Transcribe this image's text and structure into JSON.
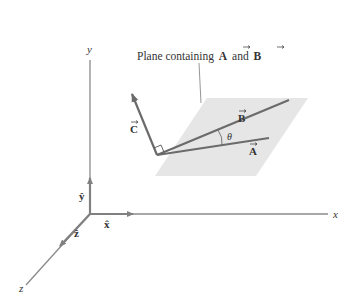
{
  "diagram": {
    "caption": "Plane containing",
    "caption_vec_a": "A",
    "caption_and": "and",
    "caption_vec_b": "B",
    "axes": {
      "x_label": "x",
      "y_label": "y",
      "z_label": "z"
    },
    "unit_vectors": {
      "x_hat": "x̂",
      "y_hat": "ŷ",
      "z_hat": "ẑ"
    },
    "vectors": {
      "a_label": "A",
      "b_label": "B",
      "c_label": "C"
    },
    "angle_label": "θ",
    "colors": {
      "axis": "#7a7a7a",
      "vector": "#6b6b6b",
      "plane": "#e6e6e6",
      "text": "#333333"
    }
  }
}
